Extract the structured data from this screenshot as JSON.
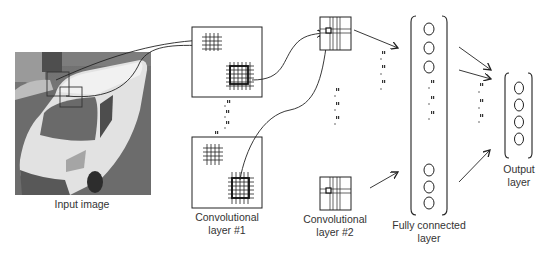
{
  "diagram": {
    "colors": {
      "line": "#222222",
      "photo_dark": "#5a5a5a",
      "photo_light": "#d8d8d8",
      "label": "#333333"
    },
    "stages": [
      {
        "id": "input",
        "lines": [
          "Input image"
        ]
      },
      {
        "id": "conv1",
        "lines": [
          "Convolutional",
          "layer #1"
        ]
      },
      {
        "id": "conv2",
        "lines": [
          "Convolutional",
          "layer #2"
        ]
      },
      {
        "id": "fc",
        "lines": [
          "Fully connected",
          "layer"
        ],
        "visible_neurons_top": 3,
        "visible_neurons_bottom": 3
      },
      {
        "id": "output",
        "lines": [
          "Output",
          "layer"
        ],
        "neurons": 4
      }
    ],
    "input_image": {
      "subject": "white van photo (grayscale)"
    }
  }
}
